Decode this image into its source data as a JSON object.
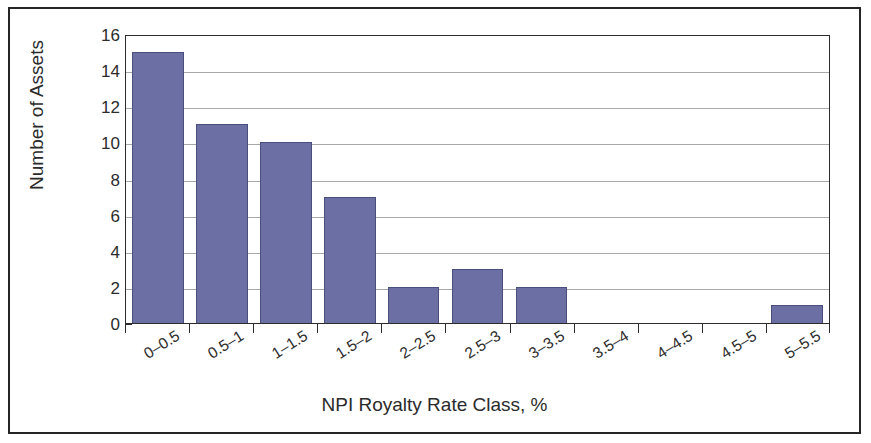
{
  "chart_data": {
    "type": "bar",
    "title": "",
    "xlabel": "NPI Royalty Rate Class, %",
    "ylabel": "Number of Assets",
    "categories": [
      "0–0.5",
      "0.5–1",
      "1–1.5",
      "1.5–2",
      "2–2.5",
      "2.5–3",
      "3–3.5",
      "3.5–4",
      "4–4.5",
      "4.5–5",
      "5–5.5"
    ],
    "values": [
      15,
      11,
      10,
      7,
      2,
      3,
      2,
      0,
      0,
      0,
      1
    ],
    "ylim": [
      0,
      16
    ],
    "ytick_values": [
      0,
      2,
      4,
      6,
      8,
      10,
      12,
      14,
      16
    ],
    "ytick_labels": [
      "0",
      "2",
      "4",
      "6",
      "8",
      "10",
      "12",
      "14",
      "16"
    ],
    "grid": true,
    "grid_axis": "y",
    "legend": false,
    "bar_color": "#6b6fa3",
    "bar_edge_color": "#4a4e7d",
    "axis_color": "#2b2b2b",
    "gridline_color": "#a9a9a9",
    "background_color": "#ffffff",
    "xtick_label_rotation": -32
  }
}
